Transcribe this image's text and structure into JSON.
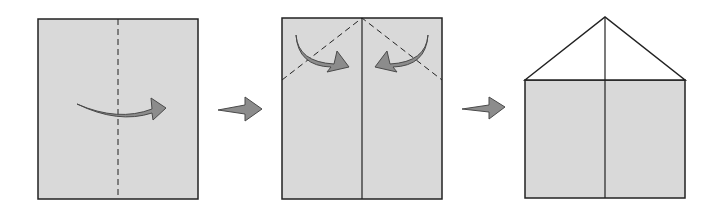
{
  "diagram": {
    "type": "origami-fold-steps",
    "colors": {
      "paper": "#d9d9d9",
      "outline": "#222222",
      "arrow_fill": "#8c8c8c",
      "arrow_stroke": "#4a4a4a",
      "background": "#ffffff"
    },
    "steps": [
      {
        "id": 1,
        "description": "Square with vertical dashed center fold line; curved arrow folding left half over to the right"
      },
      {
        "id": 2,
        "description": "Rectangle with solid center crease; two dashed diagonal lines from top center to sides; curved arrows folding top corners inward"
      },
      {
        "id": 3,
        "description": "House shape: rectangle with triangular roof formed by folded corners; center line"
      }
    ],
    "step_arrows": 2
  }
}
